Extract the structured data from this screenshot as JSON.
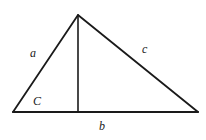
{
  "diagram": {
    "type": "triangle-with-altitude",
    "stroke_color": "#1a1a1a",
    "background": "#ffffff",
    "vertices": {
      "apex": [
        78,
        15
      ],
      "bottom_left": [
        13,
        112
      ],
      "bottom_right": [
        198,
        112
      ]
    },
    "altitude": {
      "from": [
        78,
        15
      ],
      "to": [
        78,
        112
      ]
    },
    "labels": {
      "side_a": "a",
      "side_b": "b",
      "side_c": "c",
      "angle_C": "C"
    }
  }
}
